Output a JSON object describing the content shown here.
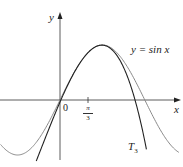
{
  "figure": {
    "axes": {
      "x_label": "x",
      "y_label": "y",
      "origin_label": "0",
      "tick_label": {
        "numerator": "π",
        "denominator": "3"
      }
    },
    "curves": [
      {
        "name": "sin",
        "label": "y = sin x",
        "color": "#8a8a8a"
      },
      {
        "name": "T3",
        "label_main": "T",
        "label_sub": "3",
        "color": "#222222"
      }
    ]
  },
  "chart_data": {
    "type": "line",
    "title": "",
    "xlabel": "x",
    "ylabel": "y",
    "x_ticks": [
      "0",
      "π/3"
    ],
    "series": [
      {
        "name": "y = sin x",
        "function": "sin(x)",
        "domain": [
          -2.2,
          4.4
        ]
      },
      {
        "name": "T3",
        "function": "third-degree Taylor polynomial of sin x centered at π/3",
        "domain": [
          -0.9,
          3.2
        ]
      }
    ],
    "grid": false,
    "legend": "inline labels"
  }
}
